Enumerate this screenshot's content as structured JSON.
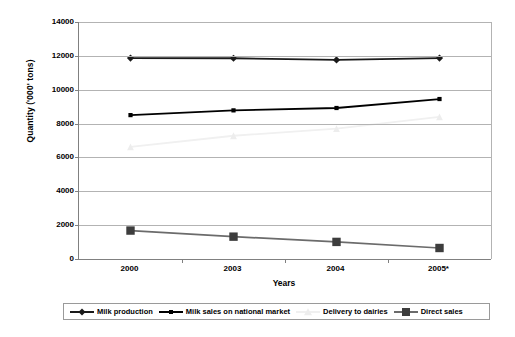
{
  "chart_data": {
    "type": "line",
    "title": "",
    "xlabel": "Years",
    "ylabel": "Quantity ('000' tons)",
    "categories": [
      "2000",
      "2003",
      "2004",
      "2005*"
    ],
    "ylim": [
      0,
      14000
    ],
    "ytick_labels": [
      "0",
      "2000",
      "4000",
      "6000",
      "8000",
      "10000",
      "12000",
      "14000"
    ],
    "ytick_values": [
      0,
      2000,
      4000,
      6000,
      8000,
      10000,
      12000,
      14000
    ],
    "grid": "horizontal",
    "legend_position": "bottom",
    "series": [
      {
        "name": "Milk production",
        "values": [
          11870,
          11860,
          11760,
          11870
        ],
        "color": "#1a1a1a",
        "marker": "diamond",
        "marker_color": "#1a1a1a"
      },
      {
        "name": "Milk sales on national market",
        "values": [
          8500,
          8780,
          8920,
          9450
        ],
        "color": "#000000",
        "marker": "square",
        "marker_color": "#000000"
      },
      {
        "name": "Delivery to dairies",
        "values": [
          6620,
          7280,
          7700,
          8400
        ],
        "color": "#f0f0f0",
        "marker": "triangle",
        "marker_color": "#ededed"
      },
      {
        "name": "Direct sales",
        "values": [
          1680,
          1320,
          1010,
          650
        ],
        "color": "#6b6b6b",
        "marker": "square-large",
        "marker_color": "#3d3d3d"
      }
    ]
  },
  "axes": {
    "y_title": "Quantity ('000' tons)",
    "x_title": "Years"
  },
  "legend": {
    "items": [
      {
        "label": "Milk production"
      },
      {
        "label": "Milk sales on national market"
      },
      {
        "label": "Delivery to dairies"
      },
      {
        "label": "Direct sales"
      }
    ]
  }
}
